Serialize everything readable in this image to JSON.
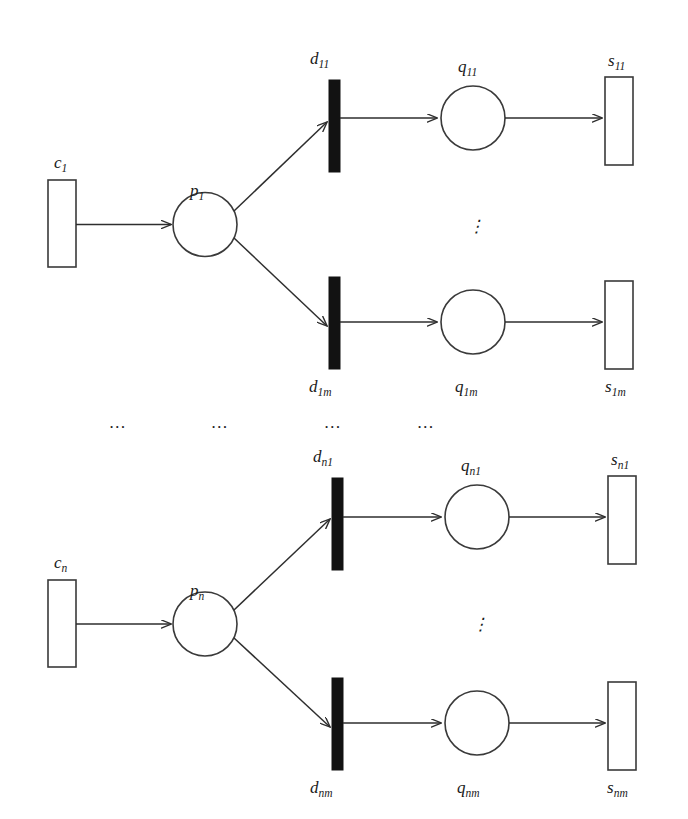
{
  "figure": {
    "type": "petri-net",
    "background_color": "#ffffff",
    "stroke_color": "#2e2e2e",
    "transition_fill": "#121212",
    "place_fill": "#ffffff"
  },
  "labels": {
    "c1": "c",
    "c1_sub": "1",
    "p1": "p",
    "p1_sub": "1",
    "d11": "d",
    "d11_sub": "11",
    "q11": "q",
    "q11_sub": "11",
    "s11": "s",
    "s11_sub": "11",
    "d1m": "d",
    "d1m_sub": "1m",
    "q1m": "q",
    "q1m_sub": "1m",
    "s1m": "s",
    "s1m_sub": "1m",
    "cn": "c",
    "cn_sub": "n",
    "pn": "p",
    "pn_sub": "n",
    "dn1": "d",
    "dn1_sub": "n1",
    "qn1": "q",
    "qn1_sub": "n1",
    "sn1": "s",
    "sn1_sub": "n1",
    "dnm": "d",
    "dnm_sub": "nm",
    "qnm": "q",
    "qnm_sub": "nm",
    "snm": "s",
    "snm_sub": "nm"
  },
  "ellipses": {
    "vertical_top": "⋮",
    "vertical_bottom": "⋮",
    "horizontal_1": "…",
    "horizontal_2": "…",
    "horizontal_3": "…",
    "horizontal_4": "…"
  },
  "nodes": {
    "resource_boxes": [
      {
        "name": "c1",
        "label_key": "c1"
      },
      {
        "name": "s11",
        "label_key": "s11"
      },
      {
        "name": "s1m",
        "label_key": "s1m"
      },
      {
        "name": "cn",
        "label_key": "cn"
      },
      {
        "name": "sn1",
        "label_key": "sn1"
      },
      {
        "name": "snm",
        "label_key": "snm"
      }
    ],
    "places": [
      {
        "name": "p1",
        "label_key": "p1"
      },
      {
        "name": "q11",
        "label_key": "q11"
      },
      {
        "name": "q1m",
        "label_key": "q1m"
      },
      {
        "name": "pn",
        "label_key": "pn"
      },
      {
        "name": "qn1",
        "label_key": "qn1"
      },
      {
        "name": "qnm",
        "label_key": "qnm"
      }
    ],
    "transitions": [
      {
        "name": "d11",
        "label_key": "d11"
      },
      {
        "name": "d1m",
        "label_key": "d1m"
      },
      {
        "name": "dn1",
        "label_key": "dn1"
      },
      {
        "name": "dnm",
        "label_key": "dnm"
      }
    ]
  },
  "arcs": [
    {
      "from": "c1",
      "to": "p1"
    },
    {
      "from": "p1",
      "to": "d11"
    },
    {
      "from": "p1",
      "to": "d1m"
    },
    {
      "from": "d11",
      "to": "q11"
    },
    {
      "from": "q11",
      "to": "s11"
    },
    {
      "from": "d1m",
      "to": "q1m"
    },
    {
      "from": "q1m",
      "to": "s1m"
    },
    {
      "from": "cn",
      "to": "pn"
    },
    {
      "from": "pn",
      "to": "dn1"
    },
    {
      "from": "pn",
      "to": "dnm"
    },
    {
      "from": "dn1",
      "to": "qn1"
    },
    {
      "from": "qn1",
      "to": "sn1"
    },
    {
      "from": "dnm",
      "to": "qnm"
    },
    {
      "from": "qnm",
      "to": "snm"
    }
  ]
}
